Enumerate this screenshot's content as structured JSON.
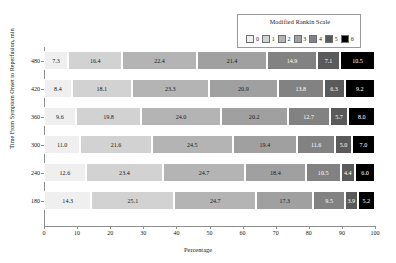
{
  "legend": {
    "title": "Modified Rankin Scale",
    "entries": [
      {
        "label": "0",
        "color": "#efefef"
      },
      {
        "label": "1",
        "color": "#d2d2d2"
      },
      {
        "label": "2",
        "color": "#b4b4b4"
      },
      {
        "label": "3",
        "color": "#a0a0a0"
      },
      {
        "label": "4",
        "color": "#828282"
      },
      {
        "label": "5",
        "color": "#5a5a5a"
      },
      {
        "label": "6",
        "color": "#000000"
      }
    ]
  },
  "axes": {
    "xlabel": "Percentage",
    "ylabel": "Time From Symptom Onset to Reperfusion, min",
    "xticks": [
      "0",
      "10",
      "20",
      "30",
      "40",
      "50",
      "60",
      "70",
      "80",
      "90",
      "100"
    ],
    "yticks": [
      "480",
      "420",
      "360",
      "300",
      "240",
      "180"
    ]
  },
  "chart_data": {
    "type": "bar",
    "orientation": "horizontal",
    "stacked": true,
    "normalized": true,
    "title": "",
    "xlabel": "Percentage",
    "ylabel": "Time From Symptom Onset to Reperfusion, min",
    "xlim": [
      0,
      100
    ],
    "grid": false,
    "legend_title": "Modified Rankin Scale",
    "legend_position": "top-right",
    "categories": [
      "480",
      "420",
      "360",
      "300",
      "240",
      "180"
    ],
    "series": [
      {
        "name": "0",
        "color": "#efefef",
        "values": [
          7.3,
          8.4,
          9.6,
          11.0,
          12.6,
          14.3
        ]
      },
      {
        "name": "1",
        "color": "#d2d2d2",
        "values": [
          16.4,
          18.1,
          19.8,
          21.6,
          23.4,
          25.1
        ]
      },
      {
        "name": "2",
        "color": "#b4b4b4",
        "values": [
          22.4,
          23.3,
          24.0,
          24.5,
          24.7,
          24.7
        ]
      },
      {
        "name": "3",
        "color": "#a0a0a0",
        "values": [
          21.4,
          20.9,
          20.2,
          19.4,
          18.4,
          17.3
        ]
      },
      {
        "name": "4",
        "color": "#828282",
        "values": [
          14.9,
          13.8,
          12.7,
          11.6,
          10.5,
          9.5
        ]
      },
      {
        "name": "5",
        "color": "#5a5a5a",
        "values": [
          7.1,
          6.3,
          5.7,
          5.0,
          4.4,
          3.9
        ]
      },
      {
        "name": "6",
        "color": "#000000",
        "values": [
          10.5,
          9.2,
          8.0,
          7.0,
          6.0,
          5.2
        ]
      }
    ],
    "rows": [
      {
        "category": "480",
        "labels": [
          "7.3",
          "16.4",
          "22.4",
          "21.4",
          "14.9",
          "7.1",
          "10.5"
        ]
      },
      {
        "category": "420",
        "labels": [
          "8.4",
          "18.1",
          "23.3",
          "20.9",
          "13.8",
          "6.3",
          "9.2"
        ]
      },
      {
        "category": "360",
        "labels": [
          "9.6",
          "19.8",
          "24.0",
          "20.2",
          "12.7",
          "5.7",
          "8.0"
        ]
      },
      {
        "category": "300",
        "labels": [
          "11.0",
          "21.6",
          "24.5",
          "19.4",
          "11.6",
          "5.0",
          "7.0"
        ]
      },
      {
        "category": "240",
        "labels": [
          "12.6",
          "23.4",
          "24.7",
          "18.4",
          "10.5",
          "4.4",
          "6.0"
        ]
      },
      {
        "category": "180",
        "labels": [
          "14.3",
          "25.1",
          "24.7",
          "17.3",
          "9.5",
          "3.9",
          "5.2"
        ]
      }
    ]
  }
}
